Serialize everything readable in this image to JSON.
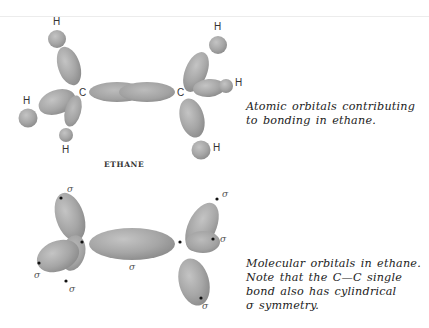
{
  "figure": {
    "top_section": {
      "label": "ETHANE",
      "atom_labels": {
        "carbon_left": "C",
        "carbon_right": "C",
        "h_top_left": "H",
        "h_mid_left": "H",
        "h_bottom_left": "H",
        "h_top_right": "H",
        "h_mid_right": "H",
        "h_bottom_right": "H"
      },
      "caption_lines": [
        "Atomic orbitals contributing",
        "to bonding in ethane."
      ]
    },
    "bottom_section": {
      "sigma_labels": {
        "left_top": "σ",
        "left_mid": "σ",
        "left_bottom": "σ",
        "center": "σ",
        "right_top": "σ",
        "right_mid": "σ",
        "right_bottom": "σ"
      },
      "caption_lines": [
        "Molecular orbitals in ethane.",
        "Note that the C—C single",
        "bond also has cylindrical",
        "σ symmetry."
      ]
    },
    "colors": {
      "orbital_fill": "#a9a9a9",
      "orbital_dark": "#8e8e8e",
      "text": "#222222",
      "background": "#ffffff"
    }
  }
}
